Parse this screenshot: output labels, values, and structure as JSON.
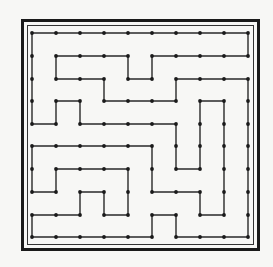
{
  "diagram": {
    "type": "grid-path",
    "grid": {
      "cols": 10,
      "rows": 10
    },
    "x_coords": [
      32,
      56,
      80,
      104,
      128,
      152,
      176,
      200,
      224,
      248
    ],
    "y_coords": [
      33,
      56,
      79,
      101,
      124,
      146,
      169,
      192,
      215,
      237
    ],
    "path": [
      [
        0,
        0
      ],
      [
        9,
        0
      ],
      [
        9,
        1
      ],
      [
        5,
        1
      ],
      [
        5,
        2
      ],
      [
        4,
        2
      ],
      [
        4,
        1
      ],
      [
        1,
        1
      ],
      [
        1,
        2
      ],
      [
        3,
        2
      ],
      [
        3,
        3
      ],
      [
        6,
        3
      ],
      [
        6,
        2
      ],
      [
        9,
        2
      ],
      [
        9,
        9
      ],
      [
        6,
        9
      ],
      [
        6,
        8
      ],
      [
        5,
        8
      ],
      [
        5,
        9
      ],
      [
        0,
        9
      ],
      [
        0,
        8
      ],
      [
        2,
        8
      ],
      [
        2,
        7
      ],
      [
        3,
        7
      ],
      [
        3,
        8
      ],
      [
        4,
        8
      ],
      [
        4,
        6
      ],
      [
        1,
        6
      ],
      [
        1,
        7
      ],
      [
        0,
        7
      ],
      [
        0,
        5
      ],
      [
        5,
        5
      ],
      [
        5,
        7
      ],
      [
        7,
        7
      ],
      [
        7,
        8
      ],
      [
        8,
        8
      ],
      [
        8,
        3
      ],
      [
        7,
        3
      ],
      [
        7,
        6
      ],
      [
        6,
        6
      ],
      [
        6,
        4
      ],
      [
        2,
        4
      ],
      [
        2,
        3
      ],
      [
        1,
        3
      ],
      [
        1,
        4
      ],
      [
        0,
        4
      ],
      [
        0,
        0
      ]
    ],
    "closed": true,
    "colors": {
      "line": "#2a2a2a",
      "node": "#1a1a1a",
      "border": "#1a1a1a",
      "background": "#f7f7f5"
    }
  }
}
